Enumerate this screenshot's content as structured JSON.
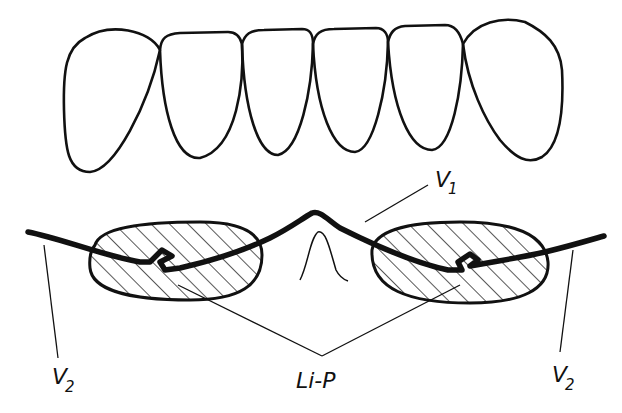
{
  "diagram": {
    "type": "dental technical line drawing",
    "colors": {
      "ink": "#111111",
      "background": "#ffffff"
    },
    "teeth_row": {
      "count": 6,
      "teeth": [
        {
          "id": "tooth-1",
          "position": "left-canine"
        },
        {
          "id": "tooth-2",
          "position": "left-lateral-incisor"
        },
        {
          "id": "tooth-3",
          "position": "left-central-incisor"
        },
        {
          "id": "tooth-4",
          "position": "right-central-incisor"
        },
        {
          "id": "tooth-5",
          "position": "right-lateral-incisor"
        },
        {
          "id": "tooth-6",
          "position": "right-canine"
        }
      ]
    },
    "appliance": {
      "left_pad": "hatched acrylic pad (left)",
      "right_pad": "hatched acrylic pad (right)",
      "wire": "thick wire with loops through pads and central bend"
    },
    "labels": {
      "v1": {
        "main": "V",
        "sub": "1"
      },
      "v2_left": {
        "main": "V",
        "sub": "2"
      },
      "v2_right": {
        "main": "V",
        "sub": "2"
      },
      "lip": {
        "text": "Li-P"
      }
    }
  }
}
